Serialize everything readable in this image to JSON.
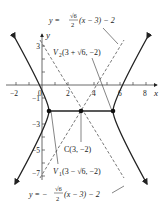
{
  "figure": {
    "type": "hyperbola",
    "center": {
      "label": "C(3, −2)",
      "x": 3,
      "y": -2
    },
    "vertices": [
      {
        "name": "V1",
        "label_sub": "1",
        "label_coords": "(3 − √6, −2)",
        "x": 0.551,
        "y": -2
      },
      {
        "name": "V2",
        "label_sub": "2",
        "label_coords": "(3 + √6, −2)",
        "x": 5.449,
        "y": -2
      }
    ],
    "asymptotes": [
      {
        "label_prefix": "y = ",
        "frac_num": "√6",
        "frac_den": "2",
        "label_suffix": "(x − 3) − 2"
      },
      {
        "label_prefix": "y = −",
        "frac_num": "√6",
        "frac_den": "2",
        "label_suffix": "(x − 3) − 2"
      }
    ],
    "x_axis": {
      "label": "x",
      "ticks": [
        "−2",
        "0",
        "2",
        "4",
        "6",
        "8"
      ]
    },
    "y_axis": {
      "label": "y",
      "ticks": [
        "3",
        "−1",
        "−3",
        "−5",
        "−7"
      ]
    },
    "v_letter": "V",
    "colors": {
      "curve": "#222222",
      "axes": "#444444",
      "dashed": "#555555"
    }
  }
}
